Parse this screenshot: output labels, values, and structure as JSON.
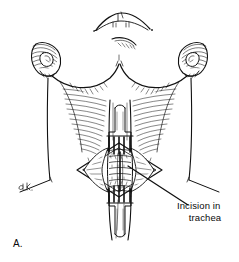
{
  "figure": {
    "panel_letter": "A.",
    "artist_initials": "e.k.",
    "background_color": "#ffffff",
    "ink_color": "#111111"
  },
  "annotations": [
    {
      "id": "incision-label",
      "line1": "Incision in",
      "line2": "trachea",
      "leader_from": [
        188,
        205
      ],
      "leader_to": [
        128,
        166
      ]
    }
  ],
  "anatomy": {
    "chin_label": "chin",
    "left_ear_label": "left ear",
    "right_ear_label": "right ear",
    "left_sternocleidomastoid_label": "left sternocleidomastoid",
    "right_sternocleidomastoid_label": "right sternocleidomastoid",
    "trachea_label": "trachea",
    "incision_field_label": "diamond surgical field",
    "upper_retractor_label": "upper rake retractor",
    "lower_retractor_label": "lower rake retractor",
    "left_shoulder_label": "left shoulder",
    "right_shoulder_label": "right shoulder"
  }
}
